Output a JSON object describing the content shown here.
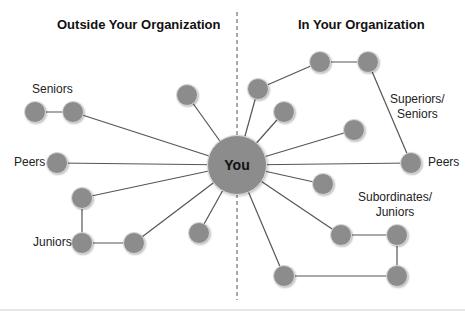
{
  "headings": {
    "left": "Outside Your Organization",
    "right": "In Your Organization"
  },
  "center": {
    "label": "You",
    "x": 237,
    "y": 165,
    "r": 30
  },
  "colors": {
    "node": "#8c8c8c",
    "line": "#555555",
    "divider": "#555555"
  },
  "labels": {
    "left_seniors": "Seniors",
    "left_peers": "Peers",
    "left_juniors": "Juniors",
    "right_superiors_1": "Superiors/",
    "right_superiors_2": "Seniors",
    "right_peers": "Peers",
    "right_subordinates_1": "Subordinates/",
    "right_subordinates_2": "Juniors"
  },
  "nodes": [
    {
      "id": "l-senior-1",
      "x": 35,
      "y": 112
    },
    {
      "id": "l-senior-2",
      "x": 73,
      "y": 112
    },
    {
      "id": "l-top",
      "x": 187,
      "y": 95
    },
    {
      "id": "l-peer",
      "x": 57,
      "y": 163
    },
    {
      "id": "l-junior-top",
      "x": 82,
      "y": 198
    },
    {
      "id": "l-junior-1",
      "x": 82,
      "y": 243
    },
    {
      "id": "l-junior-2",
      "x": 134,
      "y": 243
    },
    {
      "id": "l-bottom",
      "x": 199,
      "y": 233
    },
    {
      "id": "r-upper-1",
      "x": 258,
      "y": 89
    },
    {
      "id": "r-upper-2",
      "x": 320,
      "y": 62
    },
    {
      "id": "r-upper-3",
      "x": 368,
      "y": 62
    },
    {
      "id": "r-mid-1",
      "x": 284,
      "y": 112
    },
    {
      "id": "r-mid-2",
      "x": 354,
      "y": 130
    },
    {
      "id": "r-peer",
      "x": 411,
      "y": 163
    },
    {
      "id": "r-lower-1",
      "x": 323,
      "y": 184
    },
    {
      "id": "r-sub-1",
      "x": 341,
      "y": 235
    },
    {
      "id": "r-sub-2",
      "x": 397,
      "y": 235
    },
    {
      "id": "r-sub-3",
      "x": 397,
      "y": 276
    },
    {
      "id": "r-sub-4",
      "x": 284,
      "y": 276
    }
  ],
  "edges": [
    [
      "center",
      "l-senior-2"
    ],
    [
      "l-senior-1",
      "l-senior-2"
    ],
    [
      "center",
      "l-top"
    ],
    [
      "center",
      "l-peer"
    ],
    [
      "center",
      "l-junior-top"
    ],
    [
      "l-junior-top",
      "l-junior-1"
    ],
    [
      "l-junior-1",
      "l-junior-2"
    ],
    [
      "center",
      "l-junior-2"
    ],
    [
      "center",
      "l-bottom"
    ],
    [
      "center",
      "r-upper-1"
    ],
    [
      "r-upper-1",
      "r-upper-2"
    ],
    [
      "r-upper-2",
      "r-upper-3"
    ],
    [
      "r-upper-3",
      "r-peer"
    ],
    [
      "center",
      "r-mid-1"
    ],
    [
      "center",
      "r-mid-2"
    ],
    [
      "center",
      "r-peer"
    ],
    [
      "center",
      "r-lower-1"
    ],
    [
      "center",
      "r-sub-1"
    ],
    [
      "r-sub-1",
      "r-sub-2"
    ],
    [
      "r-sub-2",
      "r-sub-3"
    ],
    [
      "r-sub-3",
      "r-sub-4"
    ],
    [
      "center",
      "r-sub-4"
    ]
  ],
  "node_radius": 11
}
